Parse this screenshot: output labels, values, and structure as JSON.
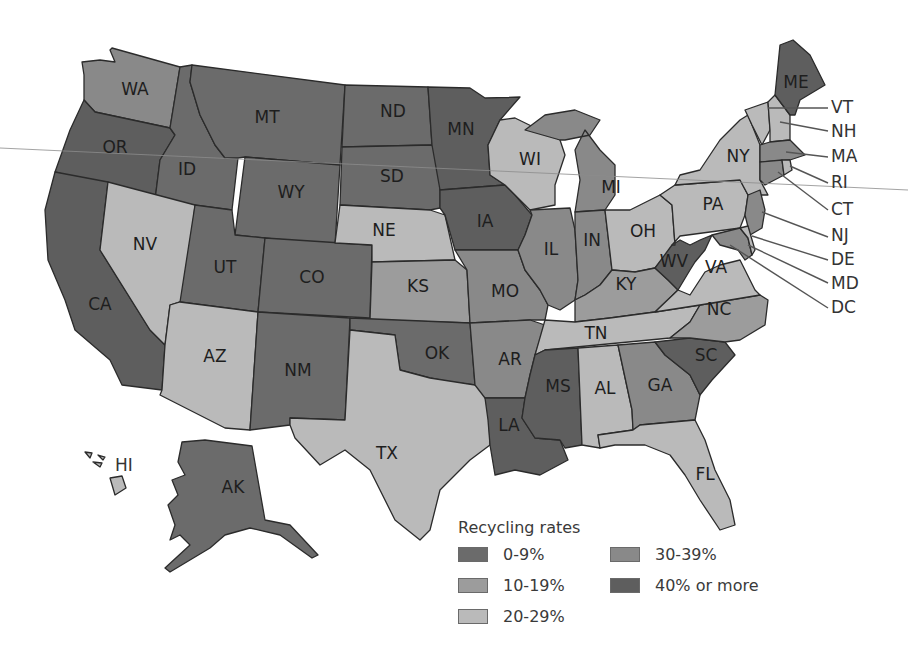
{
  "legend": {
    "title": "Recycling rates",
    "categories": [
      {
        "key": "c0",
        "label": "0-9%",
        "color": "#6b6b6b"
      },
      {
        "key": "c1",
        "label": "10-19%",
        "color": "#9c9c9c"
      },
      {
        "key": "c2",
        "label": "20-29%",
        "color": "#bababa"
      },
      {
        "key": "c3",
        "label": "30-39%",
        "color": "#898989"
      },
      {
        "key": "c4",
        "label": "40% or more",
        "color": "#5e5e5e"
      }
    ]
  },
  "states": {
    "WA": {
      "label": "WA",
      "category": "c3"
    },
    "OR": {
      "label": "OR",
      "category": "c4"
    },
    "CA": {
      "label": "CA",
      "category": "c4"
    },
    "ID": {
      "label": "ID",
      "category": "c0"
    },
    "NV": {
      "label": "NV",
      "category": "c2"
    },
    "MT": {
      "label": "MT",
      "category": "c0"
    },
    "WY": {
      "label": "WY",
      "category": "c0"
    },
    "UT": {
      "label": "UT",
      "category": "c0"
    },
    "CO": {
      "label": "CO",
      "category": "c0"
    },
    "AZ": {
      "label": "AZ",
      "category": "c2"
    },
    "NM": {
      "label": "NM",
      "category": "c0"
    },
    "ND": {
      "label": "ND",
      "category": "c0"
    },
    "SD": {
      "label": "SD",
      "category": "c0"
    },
    "NE": {
      "label": "NE",
      "category": "c2"
    },
    "KS": {
      "label": "KS",
      "category": "c1"
    },
    "OK": {
      "label": "OK",
      "category": "c0"
    },
    "TX": {
      "label": "TX",
      "category": "c2"
    },
    "MN": {
      "label": "MN",
      "category": "c4"
    },
    "IA": {
      "label": "IA",
      "category": "c4"
    },
    "MO": {
      "label": "MO",
      "category": "c3"
    },
    "AR": {
      "label": "AR",
      "category": "c3"
    },
    "LA": {
      "label": "LA",
      "category": "c4"
    },
    "WI": {
      "label": "WI",
      "category": "c2"
    },
    "IL": {
      "label": "IL",
      "category": "c3"
    },
    "MI": {
      "label": "MI",
      "category": "c3"
    },
    "IN": {
      "label": "IN",
      "category": "c3"
    },
    "OH": {
      "label": "OH",
      "category": "c2"
    },
    "KY": {
      "label": "KY",
      "category": "c1"
    },
    "TN": {
      "label": "TN",
      "category": "c2"
    },
    "MS": {
      "label": "MS",
      "category": "c4"
    },
    "AL": {
      "label": "AL",
      "category": "c2"
    },
    "GA": {
      "label": "GA",
      "category": "c3"
    },
    "FL": {
      "label": "FL",
      "category": "c2"
    },
    "SC": {
      "label": "SC",
      "category": "c4"
    },
    "NC": {
      "label": "NC",
      "category": "c1"
    },
    "VA": {
      "label": "VA",
      "category": "c2"
    },
    "WV": {
      "label": "WV",
      "category": "c4"
    },
    "PA": {
      "label": "PA",
      "category": "c2"
    },
    "NY": {
      "label": "NY",
      "category": "c2"
    },
    "ME": {
      "label": "ME",
      "category": "c4"
    },
    "VT": {
      "label": "VT",
      "category": "c2"
    },
    "NH": {
      "label": "NH",
      "category": "c2"
    },
    "MA": {
      "label": "MA",
      "category": "c3"
    },
    "RI": {
      "label": "RI",
      "category": "c2"
    },
    "CT": {
      "label": "CT",
      "category": "c3"
    },
    "NJ": {
      "label": "NJ",
      "category": "c3"
    },
    "DE": {
      "label": "DE",
      "category": "c2"
    },
    "MD": {
      "label": "MD",
      "category": "c3"
    },
    "DC": {
      "label": "DC",
      "category": "c2"
    },
    "AK": {
      "label": "AK",
      "category": "c0"
    },
    "HI": {
      "label": "HI",
      "category": "c2"
    }
  }
}
